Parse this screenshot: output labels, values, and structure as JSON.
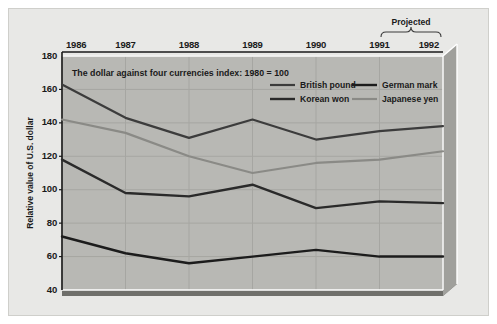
{
  "figure": {
    "background_color": "#e8e8e6",
    "plot_background_color": "#b8b8b4",
    "plot_base_color": "#8e8e8a",
    "plot_side_color": "#a0a09c",
    "grid_color": "#a6a6a2",
    "text_color": "#1a1a1a"
  },
  "chart_data": {
    "type": "line",
    "title": "The dollar against four currencies index: 1980 = 100",
    "xlabel": "",
    "ylabel": "Relative value of U.S. dollar",
    "categories": [
      "1986",
      "1987",
      "1988",
      "1989",
      "1990",
      "1991",
      "1992"
    ],
    "x": [
      1986,
      1987,
      1988,
      1989,
      1990,
      1991,
      1992
    ],
    "ylim": [
      40,
      180
    ],
    "yticks": [
      40,
      60,
      80,
      100,
      120,
      140,
      160,
      180
    ],
    "ytick_labels": [
      "40",
      "60",
      "80",
      "100",
      "120",
      "140",
      "160",
      "180"
    ],
    "grid": true,
    "legend_position": "top-right",
    "annotations": [
      {
        "text": "Projected",
        "span_categories": [
          "1991",
          "1992"
        ],
        "placement": "above-axis"
      }
    ],
    "series": [
      {
        "name": "British pound",
        "color": "#3c3c3c",
        "width": 2.2,
        "values": [
          163,
          143,
          131,
          142,
          130,
          135,
          138
        ]
      },
      {
        "name": "Korean won",
        "color": "#2a2a2a",
        "width": 2.4,
        "values": [
          118,
          98,
          96,
          103,
          89,
          93,
          92
        ]
      },
      {
        "name": "German mark",
        "color": "#1c1c1c",
        "width": 2.4,
        "values": [
          72,
          62,
          56,
          60,
          64,
          60,
          60
        ]
      },
      {
        "name": "Japanese yen",
        "color": "#8a8a86",
        "width": 2.2,
        "values": [
          142,
          134,
          120,
          110,
          116,
          118,
          123
        ]
      }
    ]
  },
  "legend": {
    "entries": [
      {
        "label": "British pound",
        "color": "#3c3c3c"
      },
      {
        "label": "German mark",
        "color": "#1c1c1c"
      },
      {
        "label": "Korean won",
        "color": "#2a2a2a"
      },
      {
        "label": "Japanese yen",
        "color": "#8a8a86"
      }
    ]
  }
}
